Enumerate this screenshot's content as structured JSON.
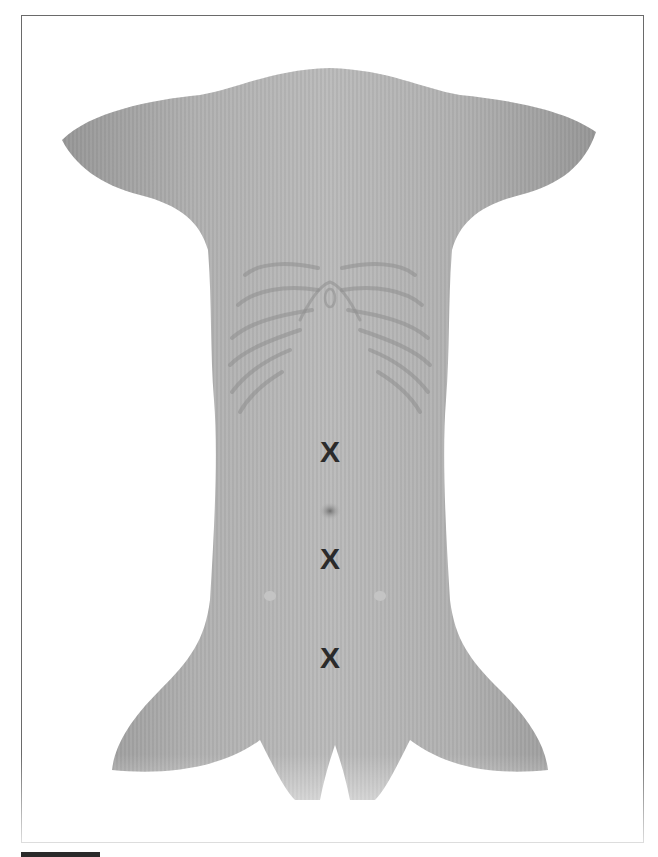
{
  "figure": {
    "background_color": "#ffffff",
    "skin_color": "#a9a9a9",
    "frame_color": "#6a6a6a",
    "marks": [
      {
        "label": "X",
        "x": 330,
        "y": 452
      },
      {
        "label": "X",
        "x": 330,
        "y": 559
      },
      {
        "label": "X",
        "x": 330,
        "y": 658
      }
    ]
  }
}
